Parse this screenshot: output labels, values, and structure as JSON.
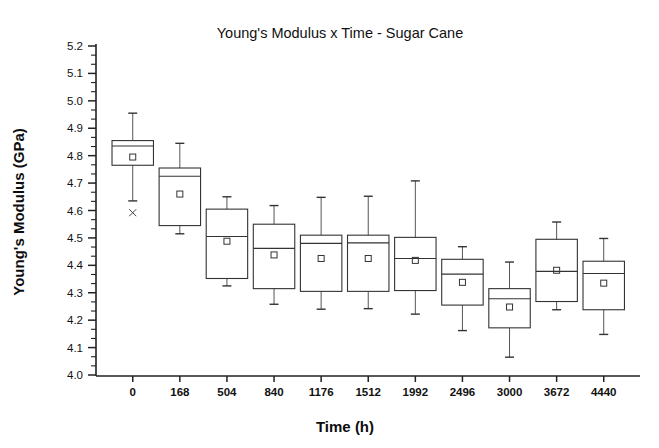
{
  "chart_data": {
    "type": "box",
    "title": "Young's Modulus x Time - Sugar Cane",
    "xlabel": "Time (h)",
    "ylabel": "Young's Modulus (GPa)",
    "ylim": [
      4.0,
      5.2
    ],
    "y_major_step": 0.1,
    "y_minor_per_major": 2,
    "grid": false,
    "legend": null,
    "ytick_labels": [
      "5.2",
      "5.1",
      "5.0",
      "4.9",
      "4.8",
      "4.7",
      "4.6",
      "4.5",
      "4.4",
      "4.3",
      "4.2",
      "4.1",
      "4.0"
    ],
    "categories": [
      "0",
      "168",
      "504",
      "840",
      "1176",
      "1512",
      "1992",
      "2496",
      "3000",
      "3672",
      "4440"
    ],
    "boxes": [
      {
        "category": "0",
        "whisker_low": 4.635,
        "q1": 4.765,
        "median": 4.835,
        "q3": 4.855,
        "whisker_high": 4.955,
        "mean": 4.795,
        "outliers": [
          4.592
        ]
      },
      {
        "category": "168",
        "whisker_low": 4.515,
        "q1": 4.545,
        "median": 4.725,
        "q3": 4.755,
        "whisker_high": 4.845,
        "mean": 4.66,
        "outliers": []
      },
      {
        "category": "504",
        "whisker_low": 4.325,
        "q1": 4.352,
        "median": 4.505,
        "q3": 4.605,
        "whisker_high": 4.65,
        "mean": 4.488,
        "outliers": []
      },
      {
        "category": "840",
        "whisker_low": 4.258,
        "q1": 4.315,
        "median": 4.462,
        "q3": 4.55,
        "whisker_high": 4.618,
        "mean": 4.438,
        "outliers": []
      },
      {
        "category": "1176",
        "whisker_low": 4.24,
        "q1": 4.305,
        "median": 4.48,
        "q3": 4.51,
        "whisker_high": 4.648,
        "mean": 4.425,
        "outliers": []
      },
      {
        "category": "1512",
        "whisker_low": 4.242,
        "q1": 4.305,
        "median": 4.482,
        "q3": 4.51,
        "whisker_high": 4.652,
        "mean": 4.425,
        "outliers": []
      },
      {
        "category": "1992",
        "whisker_low": 4.222,
        "q1": 4.308,
        "median": 4.425,
        "q3": 4.502,
        "whisker_high": 4.708,
        "mean": 4.418,
        "outliers": []
      },
      {
        "category": "2496",
        "whisker_low": 4.162,
        "q1": 4.255,
        "median": 4.368,
        "q3": 4.422,
        "whisker_high": 4.468,
        "mean": 4.338,
        "outliers": []
      },
      {
        "category": "3000",
        "whisker_low": 4.065,
        "q1": 4.172,
        "median": 4.278,
        "q3": 4.315,
        "whisker_high": 4.412,
        "mean": 4.248,
        "outliers": []
      },
      {
        "category": "3672",
        "whisker_low": 4.238,
        "q1": 4.268,
        "median": 4.378,
        "q3": 4.495,
        "whisker_high": 4.558,
        "mean": 4.382,
        "outliers": []
      },
      {
        "category": "4440",
        "whisker_low": 4.148,
        "q1": 4.238,
        "median": 4.37,
        "q3": 4.415,
        "whisker_high": 4.498,
        "mean": 4.335,
        "outliers": []
      }
    ]
  }
}
